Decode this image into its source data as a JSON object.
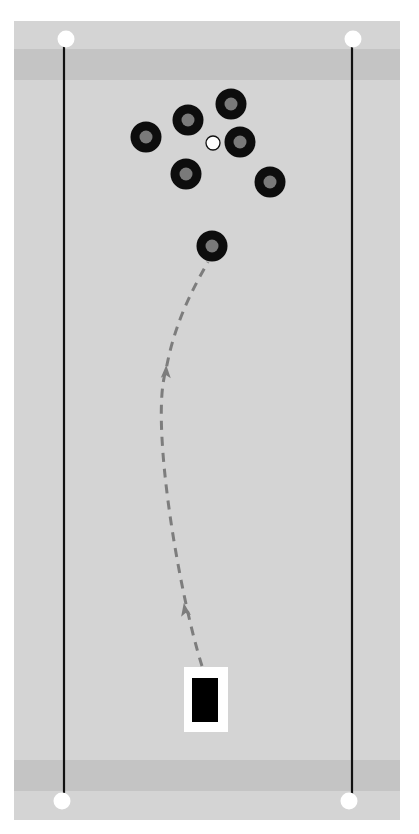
{
  "diagram": {
    "type": "curling-sheet-drill",
    "colors": {
      "ice": "#d4d4d4",
      "band": "#c4c4c4",
      "line": "#111111",
      "stone_ring": "#0d0d0d",
      "stone_handle": "#7a7a7a",
      "path": "#7d7d7d",
      "pin": "#ffffff",
      "hack_frame": "#ffffff",
      "hack": "#000000"
    },
    "sheet": {
      "x": 14,
      "y": 21,
      "w": 386,
      "h": 799
    },
    "bands": [
      {
        "name": "top-band",
        "y": 49,
        "h": 31
      },
      {
        "name": "bottom-band",
        "y": 760,
        "h": 31
      }
    ],
    "sidelines": [
      {
        "name": "left-sideline",
        "x": 64,
        "y1": 40,
        "y2": 800
      },
      {
        "name": "right-sideline",
        "x": 352,
        "y1": 40,
        "y2": 800
      }
    ],
    "corner_dots": [
      {
        "name": "top-left-dot",
        "x": 66,
        "y": 39
      },
      {
        "name": "top-right-dot",
        "x": 353,
        "y": 39
      },
      {
        "name": "bottom-left-dot",
        "x": 62,
        "y": 801
      },
      {
        "name": "bottom-right-dot",
        "x": 349,
        "y": 801
      }
    ],
    "stones": [
      {
        "x": 146,
        "y": 137
      },
      {
        "x": 188,
        "y": 120
      },
      {
        "x": 231,
        "y": 104
      },
      {
        "x": 240,
        "y": 142
      },
      {
        "x": 186,
        "y": 174
      },
      {
        "x": 270,
        "y": 182
      },
      {
        "x": 212,
        "y": 246
      }
    ],
    "target_button": {
      "x": 213,
      "y": 143,
      "r": 7
    },
    "path": {
      "d": "M 202 666 C 178 590, 150 420, 166 370 C 175 320, 195 285, 208 262",
      "arrows": [
        {
          "x": 185,
          "y": 610,
          "angle": -10
        },
        {
          "x": 166,
          "y": 372,
          "angle": 2
        }
      ]
    },
    "hack": {
      "frame": {
        "x": 184,
        "y": 667,
        "w": 44,
        "h": 65
      },
      "inner": {
        "x": 192,
        "y": 678,
        "w": 26,
        "h": 44
      }
    }
  }
}
